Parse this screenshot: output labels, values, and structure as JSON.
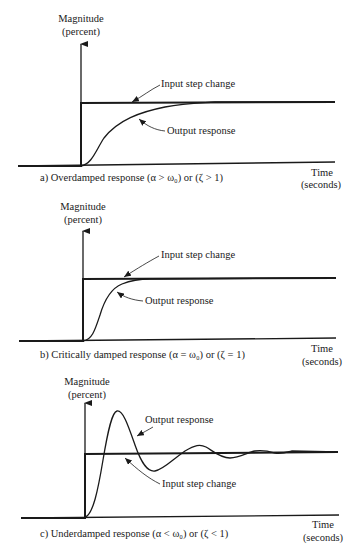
{
  "colors": {
    "ink": "#1a1a1a",
    "background": "#ffffff"
  },
  "panels": [
    {
      "id": "a",
      "y_axis_label_line1": "Magnitude",
      "y_axis_label_line2": "(percent)",
      "input_label": "Input step change",
      "output_label": "Output response",
      "x_axis_label_line1": "Time",
      "x_axis_label_line2": "(seconds)",
      "caption": "a) Overdamped response (α > ω₀) or (ζ > 1)"
    },
    {
      "id": "b",
      "y_axis_label_line1": "Magnitude",
      "y_axis_label_line2": "(percent)",
      "input_label": "Input step change",
      "output_label": "Output response",
      "x_axis_label_line1": "Time",
      "x_axis_label_line2": "(seconds)",
      "caption": "b) Critically damped response (α = ω₀) or (ζ = 1)"
    },
    {
      "id": "c",
      "y_axis_label_line1": "Magnitude",
      "y_axis_label_line2": "(percent)",
      "input_label": "Input step change",
      "output_label": "Output response",
      "x_axis_label_line1": "Time",
      "x_axis_label_line2": "(seconds)",
      "caption": "c) Underdamped response (α < ω₀) or (ζ < 1)"
    }
  ]
}
